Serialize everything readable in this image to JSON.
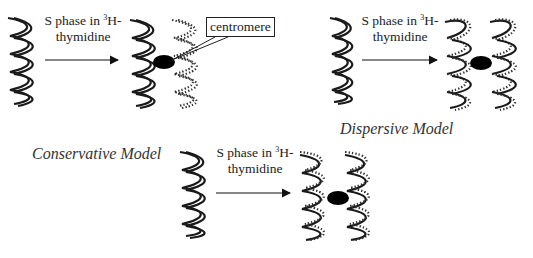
{
  "diagram": {
    "panels": [
      {
        "id": "conservative",
        "label": "Conservative Model",
        "step_text_line1_prefix": "S phase in ",
        "step_text_superscript": "3",
        "step_text_line1_suffix": "H-",
        "step_text_line2": "thymidine",
        "callout": "centromere",
        "daughters": [
          "solid (unlabeled) helix",
          "dotted (labeled) helix"
        ]
      },
      {
        "id": "dispersive",
        "label": "Dispersive Model",
        "step_text_line1_prefix": "S phase in ",
        "step_text_superscript": "3",
        "step_text_line1_suffix": "H-",
        "step_text_line2": "thymidine",
        "daughters": [
          "mixed solid/dotted helix",
          "mixed solid/dotted helix"
        ]
      },
      {
        "id": "semiconservative",
        "label": "",
        "step_text_line1_prefix": "S phase in ",
        "step_text_superscript": "3",
        "step_text_line1_suffix": "H-",
        "step_text_line2": "thymidine",
        "daughters": [
          "one solid + one dotted strand",
          "one solid + one dotted strand"
        ]
      }
    ],
    "colors": {
      "strand": "#1a1a1a",
      "labeled_strand": "#333333",
      "centromere": "#000000",
      "background": "#ffffff"
    }
  }
}
